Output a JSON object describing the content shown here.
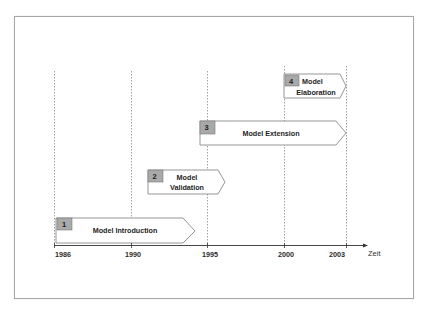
{
  "diagram": {
    "axis": {
      "label": "Zeit"
    },
    "years": [
      {
        "label": "1986",
        "x": 54
      },
      {
        "label": "1990",
        "x": 131
      },
      {
        "label": "1995",
        "x": 207
      },
      {
        "label": "2000",
        "x": 284
      },
      {
        "label": "2003",
        "x": 346
      }
    ],
    "phases": [
      {
        "number": "1",
        "line1": "Model Introduction",
        "line2": ""
      },
      {
        "number": "2",
        "line1": "Model",
        "line2": "Validation"
      },
      {
        "number": "3",
        "line1": "Model Extension",
        "line2": ""
      },
      {
        "number": "4",
        "line1": "Model",
        "line2": "Elaboration"
      }
    ],
    "colors": {
      "badge_fill": "#a9a9a9",
      "badge_stroke": "#7a7a7a",
      "arrow_stroke": "#8a8a8a",
      "gridline": "#8c8c8c",
      "axis": "#333333"
    }
  }
}
